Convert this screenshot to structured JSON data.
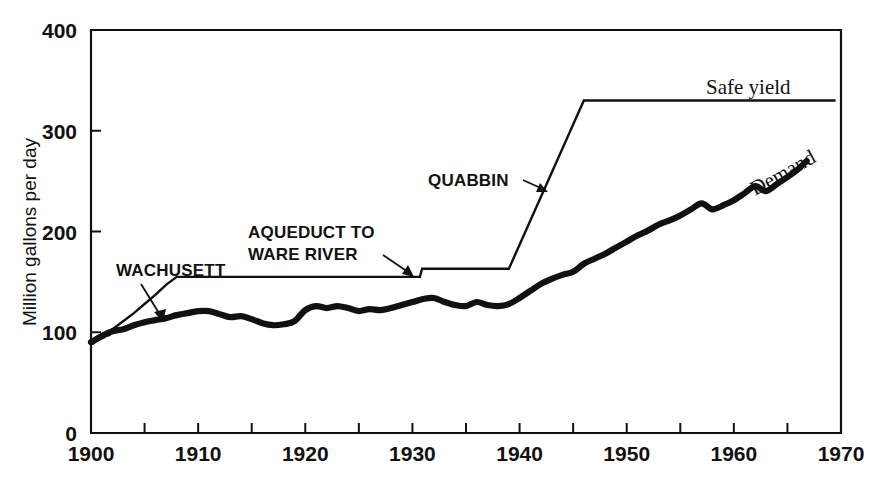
{
  "chart_data": {
    "type": "line",
    "title": "",
    "subtitle": "",
    "xlabel": "",
    "ylabel": "Million gallons per day",
    "xlim": [
      1900,
      1970
    ],
    "ylim": [
      0,
      400
    ],
    "x_ticks_major": [
      1900,
      1910,
      1920,
      1930,
      1940,
      1950,
      1960,
      1970
    ],
    "x_ticks_minor": [
      1905,
      1915,
      1925,
      1935,
      1945,
      1955,
      1965
    ],
    "y_ticks_major": [
      0,
      100,
      200,
      300,
      400
    ],
    "grid": false,
    "legend": "inline-annotations",
    "series": [
      {
        "name": "Safe yield",
        "style": "thin-line",
        "points": [
          [
            1900,
            88
          ],
          [
            1901,
            95
          ],
          [
            1902,
            103
          ],
          [
            1903,
            111
          ],
          [
            1904,
            119
          ],
          [
            1905,
            128
          ],
          [
            1906,
            137
          ],
          [
            1907,
            147
          ],
          [
            1908,
            155
          ],
          [
            1909,
            155
          ],
          [
            1915,
            155
          ],
          [
            1920,
            155
          ],
          [
            1925,
            155
          ],
          [
            1930,
            155
          ],
          [
            1930.7,
            155
          ],
          [
            1930.9,
            163
          ],
          [
            1935,
            163
          ],
          [
            1939,
            163
          ],
          [
            1946,
            330
          ],
          [
            1950,
            330
          ],
          [
            1955,
            330
          ],
          [
            1960,
            330
          ],
          [
            1965,
            330
          ],
          [
            1969.5,
            330
          ]
        ]
      },
      {
        "name": "Demand",
        "style": "thick-line",
        "points": [
          [
            1900,
            90
          ],
          [
            1901,
            96
          ],
          [
            1902,
            101
          ],
          [
            1903,
            103
          ],
          [
            1904,
            107
          ],
          [
            1905,
            110
          ],
          [
            1906,
            112
          ],
          [
            1907,
            114
          ],
          [
            1908,
            117
          ],
          [
            1909,
            119
          ],
          [
            1910,
            121
          ],
          [
            1911,
            121
          ],
          [
            1912,
            118
          ],
          [
            1913,
            115
          ],
          [
            1914,
            116
          ],
          [
            1915,
            113
          ],
          [
            1916,
            109
          ],
          [
            1917,
            107
          ],
          [
            1918,
            108
          ],
          [
            1919,
            111
          ],
          [
            1920,
            122
          ],
          [
            1921,
            126
          ],
          [
            1922,
            124
          ],
          [
            1923,
            126
          ],
          [
            1924,
            124
          ],
          [
            1925,
            121
          ],
          [
            1926,
            123
          ],
          [
            1927,
            122
          ],
          [
            1928,
            124
          ],
          [
            1929,
            127
          ],
          [
            1930,
            130
          ],
          [
            1931,
            133
          ],
          [
            1932,
            134
          ],
          [
            1933,
            130
          ],
          [
            1934,
            127
          ],
          [
            1935,
            126
          ],
          [
            1936,
            130
          ],
          [
            1937,
            127
          ],
          [
            1938,
            126
          ],
          [
            1939,
            128
          ],
          [
            1940,
            134
          ],
          [
            1941,
            141
          ],
          [
            1942,
            148
          ],
          [
            1943,
            153
          ],
          [
            1944,
            157
          ],
          [
            1945,
            160
          ],
          [
            1946,
            168
          ],
          [
            1947,
            173
          ],
          [
            1948,
            178
          ],
          [
            1949,
            184
          ],
          [
            1950,
            190
          ],
          [
            1951,
            196
          ],
          [
            1952,
            201
          ],
          [
            1953,
            207
          ],
          [
            1954,
            211
          ],
          [
            1955,
            216
          ],
          [
            1956,
            222
          ],
          [
            1957,
            228
          ],
          [
            1958,
            222
          ],
          [
            1959,
            226
          ],
          [
            1960,
            231
          ],
          [
            1961,
            238
          ],
          [
            1962,
            245
          ],
          [
            1963,
            240
          ],
          [
            1964,
            247
          ],
          [
            1965,
            254
          ],
          [
            1966,
            262
          ],
          [
            1966.8,
            270
          ]
        ]
      }
    ],
    "annotations": [
      {
        "id": "wachusett",
        "text": "WACHUSETT",
        "case": "upper",
        "target_year": 1904,
        "target_value": 131
      },
      {
        "id": "aqueduct",
        "text_line1": "AQUEDUCT TO",
        "text_line2": "WARE RIVER",
        "case": "upper",
        "target_year": 1931,
        "target_value": 163
      },
      {
        "id": "quabbin",
        "text": "QUABBIN",
        "case": "upper",
        "target_year": 1942,
        "target_value": 245
      },
      {
        "id": "safe-yield",
        "text": "Safe yield",
        "case": "serif",
        "target_year": 1960,
        "target_value": 330
      },
      {
        "id": "demand",
        "text": "Demand",
        "case": "serif-rotated",
        "target_year": 1963,
        "target_value": 258
      }
    ]
  },
  "axes": {
    "y_label": "Million gallons per day",
    "y_tick_labels": [
      "400",
      "300",
      "200",
      "100",
      "0"
    ],
    "x_tick_labels": [
      "1900",
      "1910",
      "1920",
      "1930",
      "1940",
      "1950",
      "1960",
      "1970"
    ]
  },
  "labels": {
    "wachusett": "WACHUSETT",
    "aqueduct_line1": "AQUEDUCT TO",
    "aqueduct_line2": "WARE RIVER",
    "quabbin": "QUABBIN",
    "safe_yield": "Safe yield",
    "demand": "Demand"
  },
  "colors": {
    "ink": "#111111",
    "background": "#ffffff"
  }
}
